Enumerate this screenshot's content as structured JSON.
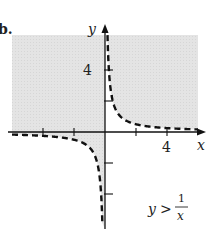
{
  "chart_data": {
    "type": "line",
    "title": "",
    "problem_label": "b.",
    "function": "1/x",
    "inequality": "y > 1/x",
    "inequality_parts": {
      "lhs": "y",
      "op": ">",
      "num": "1",
      "den": "x"
    },
    "xlabel": "x",
    "ylabel": "y",
    "xlim": [
      -6,
      6
    ],
    "ylim": [
      -6,
      6.3
    ],
    "x_ticks": [
      -4,
      -2,
      2,
      4
    ],
    "y_ticks": [
      -4,
      -2,
      2,
      4
    ],
    "x_tick_labels": [
      {
        "value": 4,
        "label": "4"
      }
    ],
    "y_tick_labels": [
      {
        "value": 4,
        "label": "4"
      }
    ],
    "boundary_style": "dashed",
    "shaded_region": "above curve",
    "series": [
      {
        "name": "y = 1/x (x<0)",
        "x_range": [
          -6,
          -0.17
        ]
      },
      {
        "name": "y = 1/x (x>0)",
        "x_range": [
          0.16,
          6
        ]
      }
    ],
    "colors": {
      "shade": "#e2e2e2",
      "axis": "#111111",
      "curve": "#111111"
    }
  }
}
